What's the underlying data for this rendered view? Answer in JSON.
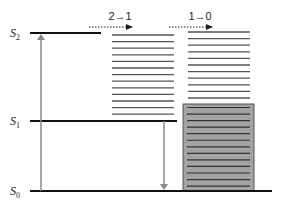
{
  "diagram": {
    "type": "jablonski-energy-level",
    "states": [
      {
        "id": "S2",
        "letter": "S",
        "sub": "2",
        "y": 33,
        "x1": 30,
        "x2": 101
      },
      {
        "id": "S1",
        "letter": "S",
        "sub": "1",
        "y": 121,
        "x1": 30,
        "x2": 177
      },
      {
        "id": "S0",
        "letter": "S",
        "sub": "0",
        "y": 191,
        "x1": 30,
        "x2": 272
      }
    ],
    "transitions": [
      {
        "label": "2→1",
        "label_x": 120,
        "label_y": 20,
        "arrow_x1": 89,
        "arrow_x2": 132,
        "arrow_y": 27
      },
      {
        "label": "1→0",
        "label_x": 200,
        "label_y": 20,
        "arrow_x1": 169,
        "arrow_x2": 212,
        "arrow_y": 27
      }
    ],
    "excitation_arrow": {
      "x": 41,
      "y_from": 191,
      "y_to": 33,
      "direction": "up"
    },
    "emission_arrow": {
      "x": 164,
      "y_from": 121,
      "y_to": 191,
      "direction": "down"
    },
    "stack_middle": {
      "x1": 112,
      "x2": 174,
      "y_start": 35,
      "count": 13,
      "spacing": 6.6
    },
    "stack_right": {
      "x1": 188,
      "x2": 250,
      "y_start": 32,
      "count": 11,
      "spacing": 6.6
    },
    "filled_box": {
      "x": 183,
      "y": 104,
      "width": 71,
      "height": 87,
      "fill": "#a3a3a3",
      "stroke": "#555555",
      "line_count": 13,
      "line_y_start": 107.5,
      "line_spacing": 6.55
    },
    "colors": {
      "level_line": "#111111",
      "stack_line": "#555555",
      "arrow": "#8a8a8a"
    }
  }
}
